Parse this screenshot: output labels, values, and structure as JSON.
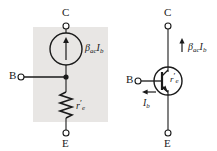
{
  "figure": {
    "kind": "bjt-equivalent-circuit",
    "panels": [
      {
        "id": "left",
        "name": "r-parameter-model",
        "shaded": true,
        "shade_color": "#e8e6e4",
        "terminals": [
          {
            "name": "collector",
            "label": "C"
          },
          {
            "name": "base",
            "label": "B"
          },
          {
            "name": "emitter",
            "label": "E"
          }
        ],
        "components": [
          {
            "name": "current-source",
            "shape": "circle-with-up-arrow",
            "label_beta": "β",
            "label_beta_sub": "ac",
            "label_current": "I",
            "label_current_sub": "b"
          },
          {
            "name": "resistor",
            "shape": "zigzag",
            "label_r": "r",
            "label_prime": "′",
            "label_r_sub": "e"
          },
          {
            "name": "junction-dot",
            "shape": "filled-dot"
          }
        ]
      },
      {
        "id": "right",
        "name": "bjt-symbol",
        "shaded": false,
        "terminals": [
          {
            "name": "collector",
            "label": "C"
          },
          {
            "name": "base",
            "label": "B"
          },
          {
            "name": "emitter",
            "label": "E"
          }
        ],
        "components": [
          {
            "name": "collector-current-arrow",
            "shape": "up-arrow",
            "label_beta": "β",
            "label_beta_sub": "ac",
            "label_current": "I",
            "label_current_sub": "b"
          },
          {
            "name": "base-current-arrow",
            "shape": "left-arrow",
            "label_current": "I",
            "label_current_sub": "b"
          },
          {
            "name": "transistor-circle",
            "shape": "circle",
            "label_r": "r",
            "label_prime": "′",
            "label_r_sub": "e"
          }
        ]
      }
    ],
    "colors": {
      "line": "#1a1a1a",
      "shade": "#e8e6e4",
      "background": "#ffffff"
    }
  }
}
